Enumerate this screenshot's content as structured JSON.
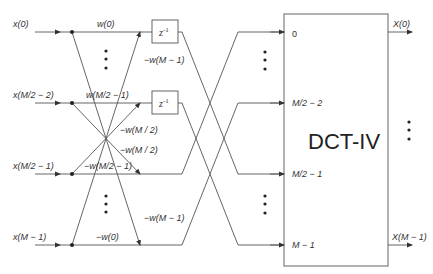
{
  "inputs": [
    {
      "label": "x(0)"
    },
    {
      "label": "x(M/2 − 2)"
    },
    {
      "label": "x(M/2 − 1)"
    },
    {
      "label": "x(M − 1)"
    }
  ],
  "weights": {
    "w0": "w(0)",
    "neg_wM1_top": "−w(M − 1)",
    "wM2m1": "w(M/2 − 1)",
    "neg_wM2_a": "−w(M / 2)",
    "neg_wM2_b": "−w(M / 2)",
    "neg_wM2m1": "−w(M/2 − 1)",
    "neg_wM1_bot": "−w(M − 1)",
    "neg_w0": "−w(0)"
  },
  "delays": [
    {
      "base": "z",
      "exp": "-1"
    },
    {
      "base": "z",
      "exp": "-1"
    }
  ],
  "dct": {
    "title": "DCT-IV",
    "ports": [
      "0",
      "M/2 − 2",
      "M/2 − 1",
      "M − 1"
    ]
  },
  "outputs": [
    {
      "label": "X(0)"
    },
    {
      "label": "X(M − 1)"
    }
  ],
  "colors": {
    "line": "#555555",
    "text": "#333333",
    "background": "#ffffff"
  }
}
